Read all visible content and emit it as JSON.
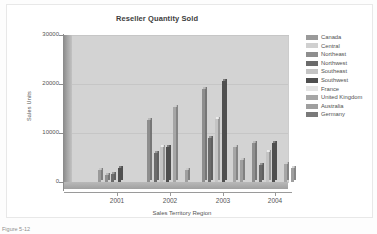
{
  "chart_data": {
    "type": "bar",
    "title": "Reseller Quantity Sold",
    "xlabel": "Sales Territory Region",
    "ylabel": "Sales Units",
    "categories": [
      "2001",
      "2002",
      "2003",
      "2004"
    ],
    "ylim": [
      0,
      30000
    ],
    "ytick_labels": [
      "0",
      "10000",
      "20000",
      "30000"
    ],
    "ytick_values": [
      0,
      10000,
      20000,
      30000
    ],
    "grid": true,
    "legend_position": "right",
    "series": [
      {
        "name": "Canada",
        "color": "#9a9a9a",
        "values": [
          2500,
          0,
          0,
          0
        ]
      },
      {
        "name": "Central",
        "color": "#d0d0d0",
        "values": [
          0,
          0,
          0,
          0
        ]
      },
      {
        "name": "Northeast",
        "color": "#8e8e8e",
        "values": [
          1400,
          12600,
          18900,
          7900
        ]
      },
      {
        "name": "Northwest",
        "color": "#6b6b6b",
        "values": [
          1700,
          5900,
          9000,
          3500
        ]
      },
      {
        "name": "Southeast",
        "color": "#c4c4c4",
        "values": [
          0,
          7100,
          12800,
          6200
        ]
      },
      {
        "name": "Southwest",
        "color": "#4f4f4f",
        "values": [
          2900,
          7200,
          20700,
          8000
        ]
      },
      {
        "name": "France",
        "color": "#e4e4e4",
        "values": [
          0,
          0,
          0,
          0
        ]
      },
      {
        "name": "United Kingdom",
        "color": "#a6a6a6",
        "values": [
          0,
          15400,
          7100,
          3600
        ]
      },
      {
        "name": "Australia",
        "color": "#9f9f9f",
        "values": [
          0,
          2400,
          4400,
          2900
        ]
      },
      {
        "name": "Germany",
        "color": "#7a7a7a",
        "values": [
          0,
          0,
          0,
          0
        ]
      }
    ],
    "bars": [
      {
        "group": "2001",
        "series": "Canada",
        "value": 2500,
        "color": "#9a9a9a"
      },
      {
        "group": "2001",
        "series": "Northeast",
        "value": 1400,
        "color": "#8e8e8e"
      },
      {
        "group": "2001",
        "series": "Northwest",
        "value": 1700,
        "color": "#6b6b6b"
      },
      {
        "group": "2001",
        "series": "Southwest",
        "value": 2900,
        "color": "#4f4f4f"
      },
      {
        "group": "2002",
        "series": "Northeast",
        "value": 12600,
        "color": "#8e8e8e"
      },
      {
        "group": "2002",
        "series": "Northwest",
        "value": 5900,
        "color": "#6b6b6b"
      },
      {
        "group": "2002",
        "series": "Southeast",
        "value": 7100,
        "color": "#c4c4c4"
      },
      {
        "group": "2002",
        "series": "Southwest",
        "value": 7200,
        "color": "#4f4f4f"
      },
      {
        "group": "2002",
        "series": "United Kingdom",
        "value": 15400,
        "color": "#a6a6a6"
      },
      {
        "group": "2002",
        "series": "Australia",
        "value": 2400,
        "color": "#9f9f9f"
      },
      {
        "group": "2003",
        "series": "Northeast",
        "value": 18900,
        "color": "#8e8e8e"
      },
      {
        "group": "2003",
        "series": "Northwest",
        "value": 9000,
        "color": "#6b6b6b"
      },
      {
        "group": "2003",
        "series": "Southeast",
        "value": 12800,
        "color": "#c4c4c4"
      },
      {
        "group": "2003",
        "series": "Southwest",
        "value": 20700,
        "color": "#4f4f4f"
      },
      {
        "group": "2003",
        "series": "United Kingdom",
        "value": 7100,
        "color": "#a6a6a6"
      },
      {
        "group": "2003",
        "series": "Australia",
        "value": 4400,
        "color": "#9f9f9f"
      },
      {
        "group": "2004",
        "series": "Northeast",
        "value": 7900,
        "color": "#8e8e8e"
      },
      {
        "group": "2004",
        "series": "Northwest",
        "value": 3500,
        "color": "#6b6b6b"
      },
      {
        "group": "2004",
        "series": "Southeast",
        "value": 6200,
        "color": "#c4c4c4"
      },
      {
        "group": "2004",
        "series": "Southwest",
        "value": 8000,
        "color": "#4f4f4f"
      },
      {
        "group": "2004",
        "series": "United Kingdom",
        "value": 3600,
        "color": "#a6a6a6"
      },
      {
        "group": "2004",
        "series": "Australia",
        "value": 2900,
        "color": "#9f9f9f"
      }
    ],
    "bar_positions": [
      26,
      33,
      39,
      46,
      75,
      82,
      88,
      94,
      101,
      113,
      130,
      136,
      143,
      150,
      161,
      168,
      180,
      187,
      194,
      200,
      212,
      219
    ]
  },
  "caption": "Figure 5-12",
  "colors": {
    "plot_background": "#d3d3d3",
    "wall": "#a8a8a8",
    "axis": "#8c8c8c",
    "text": "#555555"
  }
}
